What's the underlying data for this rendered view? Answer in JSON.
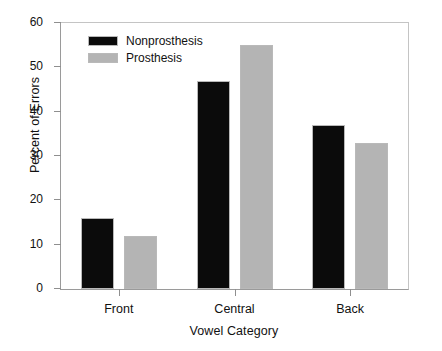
{
  "chart_data": {
    "type": "bar",
    "title": "",
    "xlabel": "Vowel Category",
    "ylabel": "Percent of Errors",
    "categories": [
      "Front",
      "Central",
      "Back"
    ],
    "series": [
      {
        "name": "Nonprosthesis",
        "color": "#0b0b0b",
        "values": [
          16,
          47,
          37
        ]
      },
      {
        "name": "Prosthesis",
        "color": "#b4b4b4",
        "values": [
          12,
          55,
          33
        ]
      }
    ],
    "ylim": [
      0,
      60
    ],
    "yticks": [
      0,
      10,
      20,
      30,
      40,
      50,
      60
    ],
    "ytick_labels": [
      "0",
      "10",
      "20",
      "30",
      "40",
      "50",
      "60"
    ],
    "grid": false,
    "legend_position": "upper left inside"
  },
  "legend": {
    "entries": [
      {
        "label": "Nonprosthesis"
      },
      {
        "label": "Prosthesis"
      }
    ]
  },
  "axes": {
    "y_title": "Percent of Errors",
    "x_title": "Vowel Category",
    "y_labels": [
      "60",
      "50",
      "40",
      "30",
      "20",
      "10",
      "0"
    ],
    "x_labels": [
      "Front",
      "Central",
      "Back"
    ]
  }
}
